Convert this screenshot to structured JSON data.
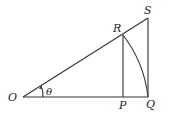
{
  "diagram": {
    "title": "",
    "points": {
      "O": {
        "label": "O",
        "x": 23,
        "y": 97
      },
      "P": {
        "label": "P",
        "x": 123,
        "y": 97
      },
      "Q": {
        "label": "Q",
        "x": 148,
        "y": 97
      },
      "R": {
        "label": "R",
        "x": 123,
        "y": 35
      },
      "S": {
        "label": "S",
        "x": 148,
        "y": 18
      }
    },
    "angle": {
      "label": "θ",
      "vertex": "O"
    },
    "segments": [
      "OQ",
      "OS",
      "SQ",
      "RP"
    ],
    "arcs": [
      "RQ (centered at O)"
    ],
    "colors": {
      "line": "#333333",
      "text": "#222222",
      "background": "#ffffff"
    }
  }
}
